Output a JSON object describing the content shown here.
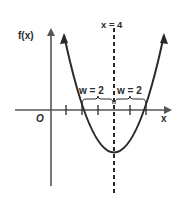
{
  "diagram": {
    "y_axis_label": "f(x)",
    "x_axis_label": "x",
    "origin_label": "O",
    "axis_of_symmetry_label": "x = 4",
    "left_width_label": "w = 2",
    "right_width_label": "w = 2",
    "colors": {
      "ink": "#2a2a2a",
      "axis": "#555555",
      "background": "#ffffff"
    }
  }
}
